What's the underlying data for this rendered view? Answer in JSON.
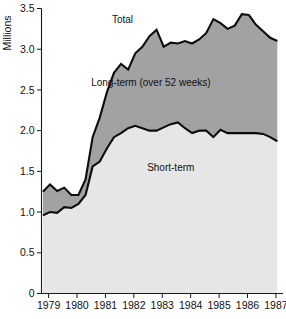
{
  "chart_data": {
    "type": "area",
    "stacked": true,
    "title": "",
    "subtitle": "",
    "xlabel": "",
    "ylabel": "Millions",
    "ylim": [
      0,
      3.5
    ],
    "xlim": [
      1978.75,
      1987.25
    ],
    "grid": false,
    "legend_position": "inline-annotations",
    "yticks": [
      "0",
      "0.5",
      "1.0",
      "1.5",
      "2.0",
      "2.5",
      "3.0",
      "3.5"
    ],
    "ytick_values": [
      0,
      0.5,
      1.0,
      1.5,
      2.0,
      2.5,
      3.0,
      3.5
    ],
    "xticks": [
      "1979",
      "1980",
      "1981",
      "1982",
      "1983",
      "1984",
      "1985",
      "1986",
      "1987"
    ],
    "xtick_values": [
      1979,
      1980,
      1981,
      1982,
      1983,
      1984,
      1985,
      1986,
      1987
    ],
    "annotations": [
      {
        "text": "Total",
        "x": 1981.6,
        "y": 3.32
      },
      {
        "text": "Long-term (over 52 weeks)",
        "x": 1982.6,
        "y": 2.55
      },
      {
        "text": "Short-term",
        "x": 1983.3,
        "y": 1.5
      }
    ],
    "colors": {
      "short_term_fill": "#e6e6e6",
      "long_term_fill": "#a2a2a2",
      "line": "#0d0d0d",
      "axis": "#1a1a1a",
      "background": "#ffffff"
    },
    "x": [
      1978.8,
      1979.05,
      1979.3,
      1979.55,
      1979.8,
      1980.05,
      1980.3,
      1980.55,
      1980.8,
      1981.05,
      1981.3,
      1981.55,
      1981.8,
      1982.05,
      1982.3,
      1982.55,
      1982.8,
      1983.05,
      1983.3,
      1983.55,
      1983.8,
      1984.05,
      1984.3,
      1984.55,
      1984.8,
      1985.05,
      1985.3,
      1985.55,
      1985.8,
      1986.05,
      1986.3,
      1986.55,
      1986.8,
      1987.05
    ],
    "series": [
      {
        "name": "Short-term",
        "values": [
          0.96,
          1.0,
          0.99,
          1.06,
          1.05,
          1.1,
          1.21,
          1.56,
          1.62,
          1.78,
          1.92,
          1.97,
          2.03,
          2.06,
          2.03,
          2.0,
          2.0,
          2.04,
          2.08,
          2.1,
          2.03,
          1.97,
          2.0,
          2.0,
          1.92,
          2.01,
          1.97,
          1.97,
          1.97,
          1.97,
          1.97,
          1.96,
          1.92,
          1.87
        ]
      },
      {
        "name": "Long-term (over 52 weeks)",
        "values": [
          0.29,
          0.34,
          0.27,
          0.24,
          0.16,
          0.11,
          0.19,
          0.36,
          0.54,
          0.69,
          0.79,
          0.85,
          0.72,
          0.89,
          1.0,
          1.16,
          1.24,
          0.99,
          1.0,
          0.97,
          1.07,
          1.1,
          1.12,
          1.2,
          1.45,
          1.31,
          1.28,
          1.32,
          1.46,
          1.45,
          1.33,
          1.26,
          1.22,
          1.23
        ]
      }
    ],
    "total_values": [
      1.25,
      1.34,
      1.26,
      1.3,
      1.21,
      1.21,
      1.4,
      1.92,
      2.16,
      2.47,
      2.71,
      2.82,
      2.75,
      2.95,
      3.03,
      3.16,
      3.24,
      3.03,
      3.08,
      3.07,
      3.1,
      3.07,
      3.12,
      3.2,
      3.37,
      3.32,
      3.25,
      3.29,
      3.43,
      3.42,
      3.3,
      3.22,
      3.14,
      3.1
    ]
  },
  "labels": {
    "y_axis_title": "Millions",
    "total": "Total",
    "long_term": "Long-term (over 52 weeks)",
    "short_term": "Short-term"
  }
}
